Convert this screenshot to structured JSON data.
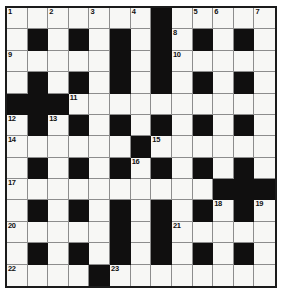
{
  "puzzle": {
    "title": "Crossword Grid",
    "type": "crossword",
    "columns": 13,
    "rows": 13,
    "colors": {
      "block": "#100f0f",
      "light": "#f7f7f5",
      "border": "#1b1b1b",
      "gridline": "#8d8d8d",
      "number": "#111111",
      "page_background": "#ffffff"
    },
    "legend": {
      "block_symbol": "#",
      "light_symbol": "."
    },
    "grid": [
      ".......#.....",
      ".#.#.#.#.#.#.",
      ".....#.#.....",
      ".#.#.#.#.#.#.",
      "###.........",
      ".#.#.#.#.#.#.",
      "......#......",
      ".#.#.#.#.#.#.",
      "..........###",
      ".#.#.#.#.#.#.",
      ".....#.#.....",
      ".#.#.#.#.#.#.",
      "....#........"
    ],
    "numbers": [
      {
        "n": 1,
        "row": 0,
        "col": 0
      },
      {
        "n": 2,
        "row": 0,
        "col": 2
      },
      {
        "n": 3,
        "row": 0,
        "col": 4
      },
      {
        "n": 4,
        "row": 0,
        "col": 6
      },
      {
        "n": 5,
        "row": 0,
        "col": 9
      },
      {
        "n": 6,
        "row": 0,
        "col": 10
      },
      {
        "n": 7,
        "row": 0,
        "col": 12
      },
      {
        "n": 8,
        "row": 1,
        "col": 8
      },
      {
        "n": 9,
        "row": 2,
        "col": 0
      },
      {
        "n": 10,
        "row": 2,
        "col": 8
      },
      {
        "n": 11,
        "row": 4,
        "col": 3
      },
      {
        "n": 12,
        "row": 5,
        "col": 0
      },
      {
        "n": 13,
        "row": 5,
        "col": 2
      },
      {
        "n": 14,
        "row": 6,
        "col": 0
      },
      {
        "n": 15,
        "row": 6,
        "col": 7
      },
      {
        "n": 16,
        "row": 7,
        "col": 6
      },
      {
        "n": 17,
        "row": 8,
        "col": 0
      },
      {
        "n": 18,
        "row": 9,
        "col": 10
      },
      {
        "n": 19,
        "row": 9,
        "col": 12
      },
      {
        "n": 20,
        "row": 10,
        "col": 0
      },
      {
        "n": 21,
        "row": 10,
        "col": 8
      },
      {
        "n": 22,
        "row": 12,
        "col": 0
      },
      {
        "n": 23,
        "row": 12,
        "col": 5
      }
    ]
  }
}
